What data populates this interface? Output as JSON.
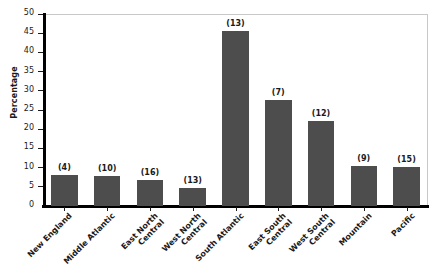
{
  "chart_data": {
    "type": "bar",
    "title": "",
    "xlabel": "",
    "ylabel": "Percentage",
    "ylim": [
      0,
      50
    ],
    "ytick_step": 5,
    "grid": false,
    "legend": null,
    "bar_color": "#4d4d4d",
    "axis_color": "#000000",
    "frame_color": "#c8c8c8",
    "categories": [
      "New England",
      "Middle Atlantic",
      "East North Central",
      "West North Central",
      "South Atlantic",
      "East South Central",
      "West South Central",
      "Mountain",
      "Pacific"
    ],
    "category_lines": [
      [
        "New England"
      ],
      [
        "Middle Atlantic"
      ],
      [
        "East North",
        "Central"
      ],
      [
        "West North",
        "Central"
      ],
      [
        "South Atlantic"
      ],
      [
        "East South",
        "Central"
      ],
      [
        "West South",
        "Central"
      ],
      [
        "Mountain"
      ],
      [
        "Pacific"
      ]
    ],
    "values": [
      8.0,
      7.9,
      6.7,
      4.7,
      45.7,
      27.7,
      22.2,
      10.4,
      10.1
    ],
    "point_labels": [
      "(4)",
      "(10)",
      "(16)",
      "(13)",
      "(13)",
      "(7)",
      "(12)",
      "(9)",
      "(15)"
    ],
    "counts": [
      4,
      10,
      16,
      13,
      13,
      7,
      12,
      9,
      15
    ],
    "yticks": [
      {
        "value": 0,
        "label": "0"
      },
      {
        "value": 5,
        "label": "5"
      },
      {
        "value": 10,
        "label": "10"
      },
      {
        "value": 15,
        "label": "15"
      },
      {
        "value": 20,
        "label": "20"
      },
      {
        "value": 25,
        "label": "25"
      },
      {
        "value": 30,
        "label": "30"
      },
      {
        "value": 35,
        "label": "35"
      },
      {
        "value": 40,
        "label": "40"
      },
      {
        "value": 45,
        "label": "45"
      },
      {
        "value": 50,
        "label": "50"
      }
    ]
  }
}
